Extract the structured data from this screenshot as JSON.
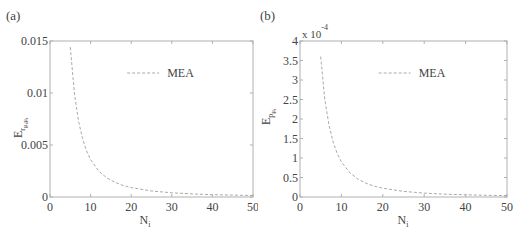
{
  "chart_data": [
    {
      "panel_label": "(a)",
      "type": "line",
      "title": "",
      "xlabel": "N_i",
      "ylabel": "E_{r_{μ_i μ_i}}",
      "xlim": [
        0,
        50
      ],
      "ylim": [
        0,
        0.015
      ],
      "xticks": [
        0,
        10,
        20,
        30,
        40,
        50
      ],
      "xtick_labels": [
        "0",
        "10",
        "20",
        "30",
        "40",
        "50"
      ],
      "yticks": [
        0,
        0.005,
        0.01,
        0.015
      ],
      "ytick_labels": [
        "0",
        "0.005",
        "0.01",
        "0.015"
      ],
      "grid": false,
      "legend": {
        "position": "upper center",
        "entries": [
          "MEA"
        ]
      },
      "series": [
        {
          "name": "MEA",
          "style": "dashed",
          "color": "#aaaaaa",
          "x": [
            5,
            6,
            7,
            8,
            9,
            10,
            12,
            14,
            16,
            18,
            20,
            25,
            30,
            35,
            40,
            45,
            50
          ],
          "values": [
            0.0144,
            0.01,
            0.00735,
            0.00563,
            0.00444,
            0.0036,
            0.0025,
            0.00184,
            0.00141,
            0.00111,
            0.0009,
            0.000576,
            0.0004,
            0.000294,
            0.000225,
            0.000178,
            0.000144
          ]
        }
      ]
    },
    {
      "panel_label": "(b)",
      "type": "line",
      "title": "",
      "xlabel": "N_i",
      "ylabel": "E_{p_{μ_i}}",
      "y_multiplier": "x 10^-4",
      "xlim": [
        0,
        50
      ],
      "ylim": [
        0,
        4
      ],
      "xticks": [
        0,
        10,
        20,
        30,
        40,
        50
      ],
      "xtick_labels": [
        "0",
        "10",
        "20",
        "30",
        "40",
        "50"
      ],
      "yticks": [
        0,
        0.5,
        1,
        1.5,
        2,
        2.5,
        3,
        3.5,
        4
      ],
      "ytick_labels": [
        "0",
        "0.5",
        "1",
        "1.5",
        "2",
        "2.5",
        "3",
        "3.5",
        "4"
      ],
      "grid": false,
      "legend": {
        "position": "upper center",
        "entries": [
          "MEA"
        ]
      },
      "series": [
        {
          "name": "MEA",
          "style": "dashed",
          "color": "#aaaaaa",
          "x": [
            5,
            6,
            7,
            8,
            9,
            10,
            12,
            14,
            16,
            18,
            20,
            25,
            30,
            35,
            40,
            45,
            50
          ],
          "values": [
            3.6,
            2.5,
            1.84,
            1.41,
            1.11,
            0.9,
            0.625,
            0.459,
            0.352,
            0.278,
            0.225,
            0.144,
            0.1,
            0.073,
            0.056,
            0.044,
            0.036
          ]
        }
      ]
    }
  ],
  "panels": {
    "a": {
      "label": "(a)",
      "xlabel_main": "N",
      "xlabel_sub": "i",
      "ylabel_main": "E",
      "ylabel_sub": "r",
      "ylabel_subsub": "μ",
      "ylabel_subsub_i": "i",
      "ylabel_subsub2": "μ",
      "ylabel_subsub2_i": "i",
      "legend_label": "MEA",
      "xtick_labels": [
        "0",
        "10",
        "20",
        "30",
        "40",
        "50"
      ],
      "ytick_labels": [
        "0",
        "0.005",
        "0.01",
        "0.015"
      ]
    },
    "b": {
      "label": "(b)",
      "multiplier_base": "x 10",
      "multiplier_exp": "-4",
      "xlabel_main": "N",
      "xlabel_sub": "i",
      "ylabel_main": "E",
      "ylabel_sub": "p",
      "ylabel_subsub": "μ",
      "ylabel_subsub_i": "i",
      "legend_label": "MEA",
      "xtick_labels": [
        "0",
        "10",
        "20",
        "30",
        "40",
        "50"
      ],
      "ytick_labels": [
        "0",
        "0.5",
        "1",
        "1.5",
        "2",
        "2.5",
        "3",
        "3.5",
        "4"
      ]
    }
  }
}
